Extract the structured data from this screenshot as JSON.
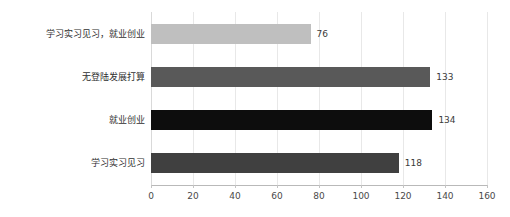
{
  "chart_data": {
    "type": "bar",
    "orientation": "horizontal",
    "title": "",
    "xlabel": "",
    "ylabel": "",
    "categories": [
      "学习实习见习，就业创业",
      "无登陆发展打算",
      "就业创业",
      "学习实习见习"
    ],
    "values": [
      76,
      133,
      134,
      118
    ],
    "value_labels": [
      "76",
      "133",
      "134",
      "118"
    ],
    "bar_colors": [
      "#bfbfbf",
      "#595959",
      "#0d0d0d",
      "#404040"
    ],
    "xlim": [
      0,
      160
    ],
    "xticks": [
      0,
      20,
      40,
      60,
      80,
      100,
      120,
      140,
      160
    ],
    "xtick_labels": [
      "0",
      "20",
      "40",
      "60",
      "80",
      "100",
      "120",
      "140",
      "160"
    ],
    "grid": true,
    "grid_axis": "x",
    "legend": false,
    "background_color": "#ffffff",
    "axis_color": "#b9b9b9",
    "gridline_color": "#e8e8e8",
    "label_color": "#2f2f2f"
  }
}
